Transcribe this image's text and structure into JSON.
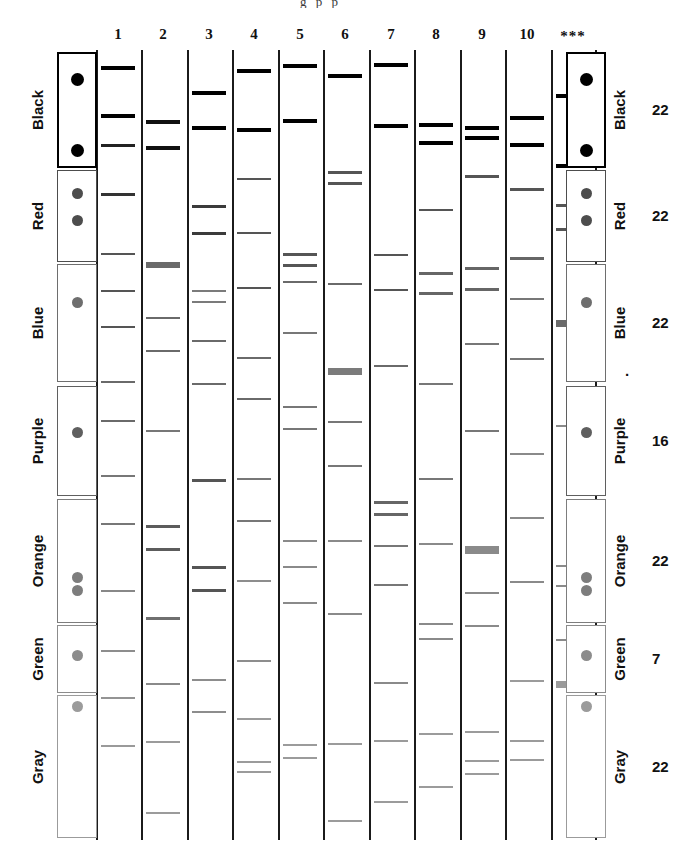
{
  "figure": {
    "title_cut": "g  p       p",
    "lane_headers": [
      "1",
      "2",
      "3",
      "4",
      "5",
      "6",
      "7",
      "8",
      "9",
      "10",
      "***"
    ],
    "colors": {
      "black": "#000000",
      "red": "#555555",
      "blue": "#777777",
      "purple": "#666666",
      "orange": "#808080",
      "green": "#8a8a8a",
      "gray": "#9a9a9a",
      "rule": "#1b1b1b",
      "background": "#ffffff"
    },
    "groups": [
      {
        "name": "Black",
        "count": "22",
        "top": 52,
        "height": 116,
        "shade": "#000000",
        "stroke": "#000000",
        "stroke_width": 2.5,
        "dots": [
          0.24,
          0.85
        ]
      },
      {
        "name": "Red",
        "count": "22",
        "top": 170,
        "height": 92,
        "shade": "#4d4d4d",
        "stroke": "#4d4d4d",
        "stroke_width": 1.6,
        "dots": [
          0.25,
          0.55
        ]
      },
      {
        "name": "Blue",
        "count": "22",
        "top": 264,
        "height": 118,
        "shade": "#6e6e6e",
        "stroke": "#6e6e6e",
        "stroke_width": 1.4,
        "dots": [
          0.33
        ]
      },
      {
        "name": "Purple",
        "count": "16",
        "top": 386,
        "height": 110,
        "shade": "#5f5f5f",
        "stroke": "#5f5f5f",
        "stroke_width": 1.4,
        "dots": [
          0.42
        ]
      },
      {
        "name": "Orange",
        "count": "22",
        "top": 499,
        "height": 124,
        "shade": "#7d7d7d",
        "stroke": "#7d7d7d",
        "stroke_width": 1.4,
        "dots": [
          0.63,
          0.74
        ]
      },
      {
        "name": "Green",
        "count": "7",
        "top": 625,
        "height": 68,
        "shade": "#8c8c8c",
        "stroke": "#8c8c8c",
        "stroke_width": 1.4,
        "dots": [
          0.45
        ]
      },
      {
        "name": "Gray",
        "count": "22",
        "top": 695,
        "height": 143,
        "shade": "#9b9b9b",
        "stroke": "#9b9b9b",
        "stroke_width": 1.4,
        "dots": [
          0.08
        ]
      }
    ],
    "lanes": [
      {
        "label": "1",
        "x": 96,
        "width": 44,
        "bands": [
          {
            "y": 66,
            "h": 4,
            "c": "#000000",
            "w": 1.0
          },
          {
            "y": 114,
            "h": 4,
            "c": "#000000",
            "w": 1.0
          },
          {
            "y": 144,
            "h": 3,
            "c": "#222222",
            "w": 1.0
          },
          {
            "y": 193,
            "h": 3,
            "c": "#333333",
            "w": 1.0
          },
          {
            "y": 253,
            "h": 2,
            "c": "#555555",
            "w": 1.0
          },
          {
            "y": 290,
            "h": 2,
            "c": "#555555",
            "w": 1.0
          },
          {
            "y": 326,
            "h": 2,
            "c": "#555555",
            "w": 1.0
          },
          {
            "y": 381,
            "h": 2,
            "c": "#6a6a6a",
            "w": 1.0
          },
          {
            "y": 420,
            "h": 2,
            "c": "#6a6a6a",
            "w": 1.0
          },
          {
            "y": 475,
            "h": 2,
            "c": "#777777",
            "w": 1.0
          },
          {
            "y": 523,
            "h": 2,
            "c": "#777777",
            "w": 1.0
          },
          {
            "y": 590,
            "h": 2,
            "c": "#888888",
            "w": 1.0
          },
          {
            "y": 650,
            "h": 2,
            "c": "#8d8d8d",
            "w": 1.0
          },
          {
            "y": 697,
            "h": 2,
            "c": "#949494",
            "w": 1.0
          },
          {
            "y": 745,
            "h": 2,
            "c": "#9a9a9a",
            "w": 1.0
          }
        ]
      },
      {
        "label": "2",
        "x": 141,
        "width": 44,
        "bands": [
          {
            "y": 120,
            "h": 4,
            "c": "#111111",
            "w": 1.0
          },
          {
            "y": 146,
            "h": 4,
            "c": "#111111",
            "w": 1.0
          },
          {
            "y": 262,
            "h": 6,
            "c": "#6a6a6a",
            "w": 1.0
          },
          {
            "y": 317,
            "h": 2,
            "c": "#6a6a6a",
            "w": 1.0
          },
          {
            "y": 350,
            "h": 2,
            "c": "#6a6a6a",
            "w": 1.0
          },
          {
            "y": 430,
            "h": 2,
            "c": "#777777",
            "w": 1.0
          },
          {
            "y": 525,
            "h": 3,
            "c": "#5c5c5c",
            "w": 1.0
          },
          {
            "y": 548,
            "h": 3,
            "c": "#5c5c5c",
            "w": 1.0
          },
          {
            "y": 617,
            "h": 3,
            "c": "#6f6f6f",
            "w": 1.0
          },
          {
            "y": 683,
            "h": 2,
            "c": "#8a8a8a",
            "w": 1.0
          },
          {
            "y": 741,
            "h": 2,
            "c": "#9b9b9b",
            "w": 1.0
          },
          {
            "y": 812,
            "h": 2,
            "c": "#9b9b9b",
            "w": 1.0
          }
        ]
      },
      {
        "label": "3",
        "x": 187,
        "width": 44,
        "bands": [
          {
            "y": 91,
            "h": 4,
            "c": "#000000",
            "w": 1.0
          },
          {
            "y": 126,
            "h": 4,
            "c": "#000000",
            "w": 1.0
          },
          {
            "y": 205,
            "h": 3,
            "c": "#3b3b3b",
            "w": 1.0
          },
          {
            "y": 232,
            "h": 3,
            "c": "#3b3b3b",
            "w": 1.0
          },
          {
            "y": 290,
            "h": 2,
            "c": "#7b7b7b",
            "w": 1.0
          },
          {
            "y": 301,
            "h": 2,
            "c": "#7b7b7b",
            "w": 1.0
          },
          {
            "y": 340,
            "h": 2,
            "c": "#6a6a6a",
            "w": 1.0
          },
          {
            "y": 383,
            "h": 2,
            "c": "#6a6a6a",
            "w": 1.0
          },
          {
            "y": 479,
            "h": 3,
            "c": "#555555",
            "w": 1.0
          },
          {
            "y": 566,
            "h": 3,
            "c": "#555555",
            "w": 1.0
          },
          {
            "y": 589,
            "h": 3,
            "c": "#555555",
            "w": 1.0
          },
          {
            "y": 679,
            "h": 2,
            "c": "#8d8d8d",
            "w": 1.0
          },
          {
            "y": 711,
            "h": 2,
            "c": "#8d8d8d",
            "w": 1.0
          }
        ]
      },
      {
        "label": "4",
        "x": 232,
        "width": 44,
        "bands": [
          {
            "y": 69,
            "h": 4,
            "c": "#000000",
            "w": 1.0
          },
          {
            "y": 128,
            "h": 4,
            "c": "#000000",
            "w": 1.0
          },
          {
            "y": 178,
            "h": 2,
            "c": "#555555",
            "w": 1.0
          },
          {
            "y": 232,
            "h": 2,
            "c": "#555555",
            "w": 1.0
          },
          {
            "y": 287,
            "h": 2,
            "c": "#555555",
            "w": 1.0
          },
          {
            "y": 357,
            "h": 2,
            "c": "#6a6a6a",
            "w": 1.0
          },
          {
            "y": 398,
            "h": 2,
            "c": "#6a6a6a",
            "w": 1.0
          },
          {
            "y": 478,
            "h": 2,
            "c": "#777777",
            "w": 1.0
          },
          {
            "y": 520,
            "h": 2,
            "c": "#777777",
            "w": 1.0
          },
          {
            "y": 580,
            "h": 2,
            "c": "#8d8d8d",
            "w": 1.0
          },
          {
            "y": 660,
            "h": 2,
            "c": "#8d8d8d",
            "w": 1.0
          },
          {
            "y": 718,
            "h": 2,
            "c": "#9b9b9b",
            "w": 1.0
          },
          {
            "y": 761,
            "h": 2,
            "c": "#9b9b9b",
            "w": 1.0
          },
          {
            "y": 771,
            "h": 2,
            "c": "#9b9b9b",
            "w": 1.0
          }
        ]
      },
      {
        "label": "5",
        "x": 278,
        "width": 44,
        "bands": [
          {
            "y": 64,
            "h": 4,
            "c": "#000000",
            "w": 1.0
          },
          {
            "y": 119,
            "h": 4,
            "c": "#000000",
            "w": 1.0
          },
          {
            "y": 253,
            "h": 3,
            "c": "#555555",
            "w": 1.0
          },
          {
            "y": 264,
            "h": 3,
            "c": "#555555",
            "w": 1.0
          },
          {
            "y": 281,
            "h": 2,
            "c": "#6a6a6a",
            "w": 1.0
          },
          {
            "y": 332,
            "h": 2,
            "c": "#777777",
            "w": 1.0
          },
          {
            "y": 406,
            "h": 2,
            "c": "#777777",
            "w": 1.0
          },
          {
            "y": 428,
            "h": 2,
            "c": "#777777",
            "w": 1.0
          },
          {
            "y": 540,
            "h": 2,
            "c": "#8a8a8a",
            "w": 1.0
          },
          {
            "y": 566,
            "h": 2,
            "c": "#8a8a8a",
            "w": 1.0
          },
          {
            "y": 602,
            "h": 2,
            "c": "#8a8a8a",
            "w": 1.0
          },
          {
            "y": 744,
            "h": 2,
            "c": "#9b9b9b",
            "w": 1.0
          },
          {
            "y": 757,
            "h": 2,
            "c": "#9b9b9b",
            "w": 1.0
          }
        ]
      },
      {
        "label": "6",
        "x": 323,
        "width": 44,
        "bands": [
          {
            "y": 74,
            "h": 4,
            "c": "#000000",
            "w": 1.0
          },
          {
            "y": 171,
            "h": 3,
            "c": "#555555",
            "w": 1.0
          },
          {
            "y": 182,
            "h": 3,
            "c": "#555555",
            "w": 1.0
          },
          {
            "y": 283,
            "h": 2,
            "c": "#6a6a6a",
            "w": 1.0
          },
          {
            "y": 368,
            "h": 7,
            "c": "#7b7b7b",
            "w": 1.0
          },
          {
            "y": 421,
            "h": 2,
            "c": "#777777",
            "w": 1.0
          },
          {
            "y": 465,
            "h": 2,
            "c": "#777777",
            "w": 1.0
          },
          {
            "y": 540,
            "h": 2,
            "c": "#8a8a8a",
            "w": 1.0
          },
          {
            "y": 613,
            "h": 2,
            "c": "#8a8a8a",
            "w": 1.0
          },
          {
            "y": 743,
            "h": 2,
            "c": "#9b9b9b",
            "w": 1.0
          },
          {
            "y": 820,
            "h": 2,
            "c": "#9b9b9b",
            "w": 1.0
          }
        ]
      },
      {
        "label": "7",
        "x": 369,
        "width": 44,
        "bands": [
          {
            "y": 63,
            "h": 4,
            "c": "#000000",
            "w": 1.0
          },
          {
            "y": 124,
            "h": 4,
            "c": "#000000",
            "w": 1.0
          },
          {
            "y": 254,
            "h": 2,
            "c": "#555555",
            "w": 1.0
          },
          {
            "y": 289,
            "h": 2,
            "c": "#555555",
            "w": 1.0
          },
          {
            "y": 365,
            "h": 2,
            "c": "#6a6a6a",
            "w": 1.0
          },
          {
            "y": 501,
            "h": 3,
            "c": "#666666",
            "w": 1.0
          },
          {
            "y": 513,
            "h": 3,
            "c": "#666666",
            "w": 1.0
          },
          {
            "y": 545,
            "h": 2,
            "c": "#777777",
            "w": 1.0
          },
          {
            "y": 584,
            "h": 2,
            "c": "#777777",
            "w": 1.0
          },
          {
            "y": 682,
            "h": 2,
            "c": "#8a8a8a",
            "w": 1.0
          },
          {
            "y": 740,
            "h": 2,
            "c": "#9b9b9b",
            "w": 1.0
          },
          {
            "y": 801,
            "h": 2,
            "c": "#9b9b9b",
            "w": 1.0
          }
        ]
      },
      {
        "label": "8",
        "x": 414,
        "width": 44,
        "bands": [
          {
            "y": 123,
            "h": 4,
            "c": "#000000",
            "w": 1.0
          },
          {
            "y": 141,
            "h": 4,
            "c": "#000000",
            "w": 1.0
          },
          {
            "y": 209,
            "h": 2,
            "c": "#555555",
            "w": 1.0
          },
          {
            "y": 272,
            "h": 3,
            "c": "#666666",
            "w": 1.0
          },
          {
            "y": 292,
            "h": 3,
            "c": "#666666",
            "w": 1.0
          },
          {
            "y": 383,
            "h": 2,
            "c": "#777777",
            "w": 1.0
          },
          {
            "y": 478,
            "h": 2,
            "c": "#777777",
            "w": 1.0
          },
          {
            "y": 543,
            "h": 2,
            "c": "#8a8a8a",
            "w": 1.0
          },
          {
            "y": 623,
            "h": 2,
            "c": "#8a8a8a",
            "w": 1.0
          },
          {
            "y": 638,
            "h": 2,
            "c": "#8a8a8a",
            "w": 1.0
          },
          {
            "y": 733,
            "h": 2,
            "c": "#9b9b9b",
            "w": 1.0
          },
          {
            "y": 786,
            "h": 2,
            "c": "#9b9b9b",
            "w": 1.0
          }
        ]
      },
      {
        "label": "9",
        "x": 460,
        "width": 44,
        "bands": [
          {
            "y": 126,
            "h": 4,
            "c": "#000000",
            "w": 1.0
          },
          {
            "y": 136,
            "h": 4,
            "c": "#000000",
            "w": 1.0
          },
          {
            "y": 175,
            "h": 3,
            "c": "#555555",
            "w": 1.0
          },
          {
            "y": 267,
            "h": 3,
            "c": "#666666",
            "w": 1.0
          },
          {
            "y": 288,
            "h": 3,
            "c": "#666666",
            "w": 1.0
          },
          {
            "y": 343,
            "h": 2,
            "c": "#777777",
            "w": 1.0
          },
          {
            "y": 430,
            "h": 2,
            "c": "#777777",
            "w": 1.0
          },
          {
            "y": 546,
            "h": 8,
            "c": "#8a8a8a",
            "w": 1.0
          },
          {
            "y": 592,
            "h": 2,
            "c": "#8a8a8a",
            "w": 1.0
          },
          {
            "y": 625,
            "h": 2,
            "c": "#8a8a8a",
            "w": 1.0
          },
          {
            "y": 731,
            "h": 2,
            "c": "#9b9b9b",
            "w": 1.0
          },
          {
            "y": 760,
            "h": 2,
            "c": "#9b9b9b",
            "w": 1.0
          },
          {
            "y": 773,
            "h": 2,
            "c": "#9b9b9b",
            "w": 1.0
          }
        ]
      },
      {
        "label": "10",
        "x": 505,
        "width": 44,
        "bands": [
          {
            "y": 116,
            "h": 4,
            "c": "#000000",
            "w": 1.0
          },
          {
            "y": 143,
            "h": 4,
            "c": "#000000",
            "w": 1.0
          },
          {
            "y": 188,
            "h": 3,
            "c": "#555555",
            "w": 1.0
          },
          {
            "y": 257,
            "h": 3,
            "c": "#666666",
            "w": 1.0
          },
          {
            "y": 298,
            "h": 2,
            "c": "#777777",
            "w": 1.0
          },
          {
            "y": 358,
            "h": 2,
            "c": "#777777",
            "w": 1.0
          },
          {
            "y": 453,
            "h": 2,
            "c": "#8a8a8a",
            "w": 1.0
          },
          {
            "y": 517,
            "h": 2,
            "c": "#8a8a8a",
            "w": 1.0
          },
          {
            "y": 581,
            "h": 2,
            "c": "#8a8a8a",
            "w": 1.0
          },
          {
            "y": 680,
            "h": 2,
            "c": "#9b9b9b",
            "w": 1.0
          },
          {
            "y": 740,
            "h": 2,
            "c": "#9b9b9b",
            "w": 1.0
          },
          {
            "y": 759,
            "h": 2,
            "c": "#9b9b9b",
            "w": 1.0
          }
        ]
      },
      {
        "label": "***",
        "x": 551,
        "width": 44,
        "bands": [
          {
            "y": 94,
            "h": 4,
            "c": "#000000",
            "w": 1.0
          },
          {
            "y": 164,
            "h": 4,
            "c": "#000000",
            "w": 1.0
          },
          {
            "y": 204,
            "h": 3,
            "c": "#555555",
            "w": 1.0
          },
          {
            "y": 228,
            "h": 3,
            "c": "#555555",
            "w": 1.0
          },
          {
            "y": 320,
            "h": 7,
            "c": "#6a6a6a",
            "w": 1.0
          },
          {
            "y": 425,
            "h": 2,
            "c": "#8a8a8a",
            "w": 1.0
          },
          {
            "y": 565,
            "h": 2,
            "c": "#8a8a8a",
            "w": 1.0
          },
          {
            "y": 585,
            "h": 2,
            "c": "#8a8a8a",
            "w": 1.0
          },
          {
            "y": 639,
            "h": 2,
            "c": "#8a8a8a",
            "w": 1.0
          },
          {
            "y": 681,
            "h": 7,
            "c": "#9b9b9b",
            "w": 1.0
          }
        ]
      }
    ]
  }
}
